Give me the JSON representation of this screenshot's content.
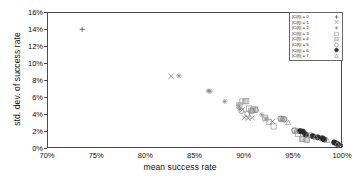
{
  "chart_data": {
    "type": "scatter",
    "title": "",
    "xlabel": "mean success rate",
    "ylabel": "std. dev. of success rate",
    "xlim": [
      70,
      100
    ],
    "ylim": [
      0,
      16
    ],
    "xticks": [
      "70%",
      "75%",
      "80%",
      "85%",
      "90%",
      "95%",
      "100%"
    ],
    "xtick_values": [
      70,
      75,
      80,
      85,
      90,
      95,
      100
    ],
    "yticks": [
      "0%",
      "2%",
      "4%",
      "6%",
      "8%",
      "10%",
      "12%",
      "14%",
      "16%"
    ],
    "ytick_values": [
      0,
      2,
      4,
      6,
      8,
      10,
      12,
      14,
      16
    ],
    "grid": false,
    "legend_position": "top-right",
    "series": [
      {
        "name": "|C(f)| = 0",
        "marker": "plus",
        "color": "#3a3a3a",
        "points": [
          [
            73.5,
            14.05
          ]
        ]
      },
      {
        "name": "|C(f)| = 1",
        "marker": "cross",
        "color": "#6d6d6d",
        "points": [
          [
            82.6,
            8.45
          ],
          [
            89.9,
            4.45
          ],
          [
            90.1,
            3.5
          ],
          [
            90.5,
            3.45
          ],
          [
            90.9,
            3.5
          ],
          [
            92.3,
            3.3
          ],
          [
            93.0,
            3.05
          ]
        ]
      },
      {
        "name": "|C(f)| = 2",
        "marker": "asterisk",
        "color": "#8a8a8a",
        "points": [
          [
            83.4,
            8.5
          ],
          [
            86.4,
            6.7
          ],
          [
            86.6,
            6.65
          ],
          [
            88.1,
            5.45
          ],
          [
            89.5,
            4.95
          ],
          [
            89.6,
            4.6
          ],
          [
            91.9,
            3.85
          ],
          [
            92.4,
            3.35
          ]
        ]
      },
      {
        "name": "|C(f)| = 3",
        "marker": "open-square",
        "color": "#9a9a9a",
        "points": [
          [
            89.9,
            5.45
          ],
          [
            90.3,
            5.5
          ],
          [
            90.6,
            4.6
          ],
          [
            91.0,
            4.45
          ],
          [
            92.6,
            3.0
          ],
          [
            93.1,
            2.45
          ],
          [
            95.6,
            1.55
          ],
          [
            96.0,
            0.95
          ],
          [
            96.5,
            0.85
          ]
        ]
      },
      {
        "name": "|C(f)| = 4",
        "marker": "shaded-square",
        "color": "#a8a8a8",
        "points": [
          [
            89.6,
            5.0
          ],
          [
            90.2,
            5.45
          ],
          [
            90.8,
            4.35
          ],
          [
            91.2,
            4.5
          ],
          [
            92.2,
            3.5
          ],
          [
            93.9,
            3.35
          ],
          [
            94.1,
            3.3
          ],
          [
            95.3,
            1.95
          ],
          [
            96.1,
            1.0
          ],
          [
            96.4,
            0.9
          ]
        ]
      },
      {
        "name": "|C(f)| = 5",
        "marker": "open-circle",
        "color": "#808080",
        "points": [
          [
            89.8,
            4.3
          ],
          [
            90.4,
            3.95
          ],
          [
            90.9,
            4.3
          ],
          [
            91.3,
            4.4
          ],
          [
            93.8,
            3.4
          ],
          [
            94.2,
            3.3
          ],
          [
            95.2,
            2.0
          ],
          [
            95.9,
            1.85
          ],
          [
            96.3,
            1.55
          ],
          [
            96.9,
            1.4
          ],
          [
            97.3,
            1.2
          ],
          [
            97.9,
            1.05
          ]
        ]
      },
      {
        "name": "|C(f)| = 6",
        "marker": "filled-circle",
        "color": "#2b2b2b",
        "points": [
          [
            95.8,
            1.9
          ],
          [
            96.1,
            1.85
          ],
          [
            96.4,
            1.5
          ],
          [
            97.1,
            1.3
          ],
          [
            97.6,
            1.15
          ],
          [
            98.1,
            1.05
          ],
          [
            98.3,
            0.9
          ],
          [
            99.3,
            0.55
          ],
          [
            99.5,
            0.45
          ],
          [
            99.7,
            0.3
          ]
        ]
      },
      {
        "name": "|C(f)| = 7",
        "marker": "open-triangle",
        "color": "#8f8f8f",
        "points": [
          [
            94.0,
            3.4
          ],
          [
            94.6,
            2.9
          ],
          [
            95.4,
            1.9
          ],
          [
            96.6,
            1.45
          ],
          [
            97.4,
            1.2
          ],
          [
            98.6,
            0.8
          ],
          [
            99.6,
            0.35
          ]
        ]
      }
    ]
  },
  "legend": {
    "items": [
      {
        "label": "|C(f)| = 0",
        "marker": "plus"
      },
      {
        "label": "|C(f)| = 1",
        "marker": "cross"
      },
      {
        "label": "|C(f)| = 2",
        "marker": "asterisk"
      },
      {
        "label": "|C(f)| = 3",
        "marker": "open-square"
      },
      {
        "label": "|C(f)| = 4",
        "marker": "shaded-square"
      },
      {
        "label": "|C(f)| = 5",
        "marker": "open-circle"
      },
      {
        "label": "|C(f)| = 6",
        "marker": "filled-circle"
      },
      {
        "label": "|C(f)| = 7",
        "marker": "open-triangle"
      }
    ]
  }
}
